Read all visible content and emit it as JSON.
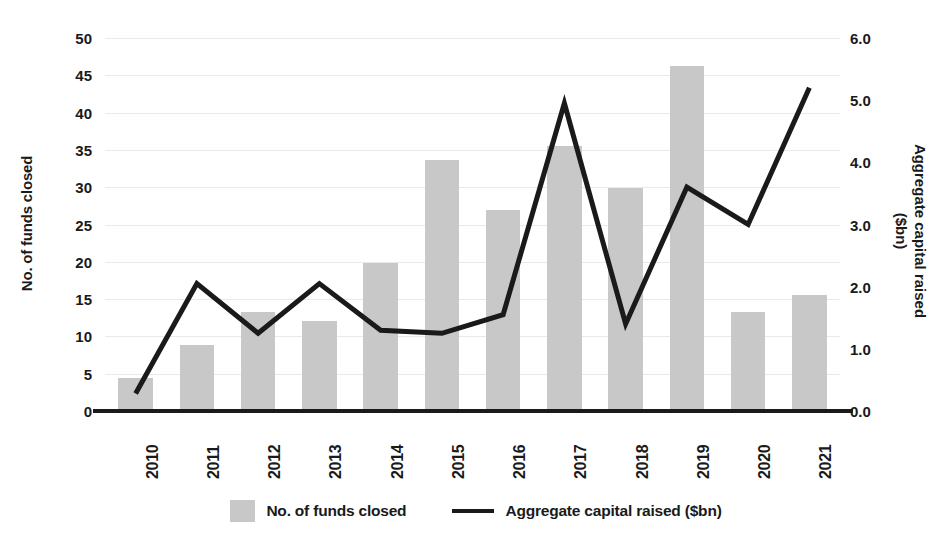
{
  "chart_data": {
    "type": "bar",
    "title": "",
    "subtitle": "",
    "xlabel": "",
    "categories": [
      "2010",
      "2011",
      "2012",
      "2013",
      "2014",
      "2015",
      "2016",
      "2017",
      "2018",
      "2019",
      "2020",
      "2021"
    ],
    "grid": true,
    "legend_position": "bottom",
    "axes": {
      "left": {
        "label": "No. of funds closed",
        "ticks": [
          "0",
          "5",
          "10",
          "15",
          "20",
          "25",
          "30",
          "35",
          "40",
          "45",
          "50"
        ],
        "tick_values": [
          0,
          5,
          10,
          15,
          20,
          25,
          30,
          35,
          40,
          45,
          50
        ],
        "ylim": [
          0,
          50
        ]
      },
      "right": {
        "label": "Aggregate capital raised\n($bn)",
        "ticks": [
          "0.0",
          "1.0",
          "2.0",
          "3.0",
          "4.0",
          "5.0",
          "6.0"
        ],
        "tick_values": [
          0,
          1,
          2,
          3,
          4,
          5,
          6
        ],
        "ylim": [
          0,
          6
        ]
      }
    },
    "series": [
      {
        "name": "No. of funds closed",
        "type": "bar",
        "axis": "left",
        "color": "#c8c8c8",
        "values": [
          4.4,
          8.9,
          13.3,
          12.1,
          19.9,
          33.7,
          26.9,
          35.5,
          29.9,
          46.3,
          13.3,
          15.5
        ]
      },
      {
        "name": "Aggregate capital raised ($bn)",
        "type": "line",
        "axis": "right",
        "color": "#1a1a1a",
        "values": [
          0.28,
          2.05,
          1.25,
          2.05,
          1.3,
          1.25,
          1.55,
          4.95,
          1.4,
          3.6,
          3.0,
          5.2
        ]
      }
    ]
  },
  "legend": {
    "items": [
      {
        "label": "No. of funds closed",
        "marker": "bar-swatch"
      },
      {
        "label": "Aggregate capital raised ($bn)",
        "marker": "line-swatch"
      }
    ]
  }
}
